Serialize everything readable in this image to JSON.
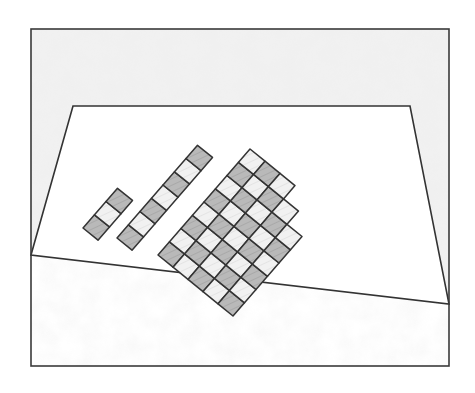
{
  "image": {
    "description": "Pencil sketch: a room interior (frame with trapezoid floor) with a checkerboard tile pattern laid diagonally on the floor, partially installed, with two loose strips of tiles to the left.",
    "style": "pencil-sketch"
  },
  "colors": {
    "background": "#ffffff",
    "line": "#3a3a3a",
    "wall_shade": "#e9e9e9",
    "tile_dark": "#b9b9b9",
    "tile_light": "#ececec",
    "hatch": "#9a9a9a"
  },
  "frame": {
    "x": 31,
    "y": 29,
    "width": 418,
    "height": 337
  },
  "floor": {
    "points": [
      [
        31,
        255
      ],
      [
        73,
        106
      ],
      [
        410,
        106
      ],
      [
        449,
        304
      ]
    ]
  },
  "tile_grid": {
    "origin": [
      158,
      255
    ],
    "u_step": [
      15,
      12.2
    ],
    "v_step": [
      11.5,
      -13.25
    ],
    "cells": [
      [
        0,
        0
      ],
      [
        0,
        1
      ],
      [
        0,
        2
      ],
      [
        0,
        3
      ],
      [
        0,
        4
      ],
      [
        0,
        5
      ],
      [
        0,
        6
      ],
      [
        0,
        7
      ],
      [
        1,
        0
      ],
      [
        1,
        1
      ],
      [
        1,
        2
      ],
      [
        1,
        3
      ],
      [
        1,
        4
      ],
      [
        1,
        5
      ],
      [
        1,
        6
      ],
      [
        1,
        7
      ],
      [
        2,
        0
      ],
      [
        2,
        1
      ],
      [
        2,
        2
      ],
      [
        2,
        3
      ],
      [
        2,
        4
      ],
      [
        2,
        5
      ],
      [
        2,
        6
      ],
      [
        2,
        7
      ],
      [
        3,
        0
      ],
      [
        3,
        1
      ],
      [
        3,
        2
      ],
      [
        3,
        3
      ],
      [
        3,
        4
      ],
      [
        3,
        5
      ],
      [
        3,
        6
      ],
      [
        4,
        0
      ],
      [
        4,
        1
      ],
      [
        4,
        2
      ],
      [
        4,
        3
      ],
      [
        4,
        4
      ],
      [
        4,
        5
      ]
    ]
  },
  "loose_strips": [
    {
      "name": "short-strip",
      "origin": [
        83,
        228
      ],
      "u_step": [
        15,
        12.2
      ],
      "v_step": [
        11.5,
        -13.25
      ],
      "cells": [
        [
          0,
          0
        ],
        [
          0,
          1
        ],
        [
          0,
          2
        ]
      ]
    },
    {
      "name": "long-strip",
      "origin": [
        117,
        238
      ],
      "u_step": [
        15,
        12.2
      ],
      "v_step": [
        11.5,
        -13.25
      ],
      "cells": [
        [
          0,
          0
        ],
        [
          0,
          1
        ],
        [
          0,
          2
        ],
        [
          0,
          3
        ],
        [
          0,
          4
        ],
        [
          0,
          5
        ],
        [
          0,
          6
        ]
      ]
    }
  ]
}
